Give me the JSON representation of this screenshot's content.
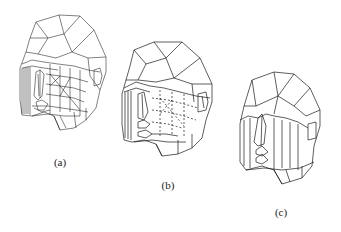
{
  "figure": {
    "panels": [
      {
        "id": "a",
        "label": "(a)",
        "description": "dense wireframe head mesh"
      },
      {
        "id": "b",
        "label": "(b)",
        "description": "medium wireframe head mesh with hidden lines dashed"
      },
      {
        "id": "c",
        "label": "(c)",
        "description": "simplified low-polygon head mesh"
      }
    ]
  }
}
